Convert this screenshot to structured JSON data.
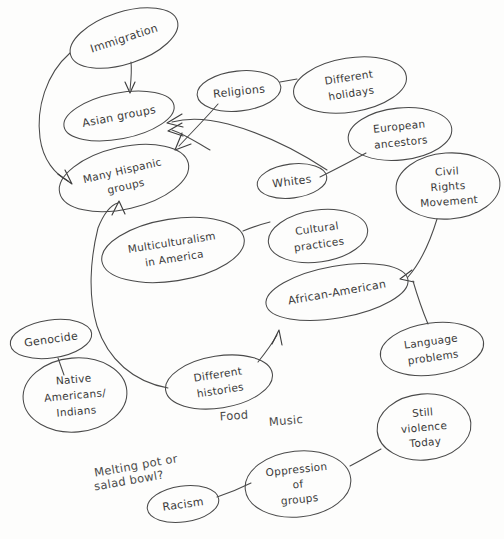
{
  "document": {
    "kind": "hand-drawn-concept-map",
    "title": "Multiculturalism in America concept map",
    "background_color": "#fdfdfc",
    "ink_color": "#4a4a4a",
    "width": 504,
    "height": 539
  },
  "nodes": [
    {
      "id": "immigration",
      "label": "Immigration",
      "lines": [
        "Immigration"
      ],
      "cx": 124,
      "cy": 38,
      "rx": 56,
      "ry": 26,
      "rot": -18
    },
    {
      "id": "asian-groups",
      "label": "Asian groups",
      "lines": [
        "Asian groups"
      ],
      "cx": 119,
      "cy": 116,
      "rx": 56,
      "ry": 23,
      "rot": -11
    },
    {
      "id": "many-hispanic",
      "label": "Many Hispanic groups",
      "lines": [
        "Many Hispanic",
        "groups"
      ],
      "cx": 124,
      "cy": 178,
      "rx": 66,
      "ry": 31,
      "rot": -13
    },
    {
      "id": "religions",
      "label": "Religions",
      "lines": [
        "Religions"
      ],
      "cx": 239,
      "cy": 91,
      "rx": 42,
      "ry": 20,
      "rot": -6
    },
    {
      "id": "different-holidays",
      "label": "Different holidays",
      "lines": [
        "Different",
        "holidays"
      ],
      "cx": 350,
      "cy": 85,
      "rx": 57,
      "ry": 27,
      "rot": -9
    },
    {
      "id": "european-ancestors",
      "label": "European ancestors",
      "lines": [
        "European",
        "ancestors"
      ],
      "cx": 400,
      "cy": 134,
      "rx": 52,
      "ry": 26,
      "rot": -6
    },
    {
      "id": "civil-rights",
      "label": "Civil Rights Movement",
      "lines": [
        "Civil",
        "Rights",
        "Movement"
      ],
      "cx": 448,
      "cy": 186,
      "rx": 52,
      "ry": 33,
      "rot": -4
    },
    {
      "id": "whites",
      "label": "Whites",
      "lines": [
        "Whites"
      ],
      "cx": 292,
      "cy": 181,
      "rx": 35,
      "ry": 17,
      "rot": -7
    },
    {
      "id": "cultural-practices",
      "label": "Cultural practices",
      "lines": [
        "Cultural",
        "practices"
      ],
      "cx": 318,
      "cy": 236,
      "rx": 50,
      "ry": 26,
      "rot": -8
    },
    {
      "id": "multiculturalism",
      "label": "Multiculturalism in America",
      "lines": [
        "Multiculturalism",
        "in America"
      ],
      "cx": 173,
      "cy": 250,
      "rx": 72,
      "ry": 31,
      "rot": -9
    },
    {
      "id": "african-american",
      "label": "African-American",
      "lines": [
        "African-American"
      ],
      "cx": 337,
      "cy": 292,
      "rx": 72,
      "ry": 26,
      "rot": -10
    },
    {
      "id": "language-problems",
      "label": "Language problems",
      "lines": [
        "Language",
        "problems"
      ],
      "cx": 432,
      "cy": 349,
      "rx": 52,
      "ry": 26,
      "rot": -8
    },
    {
      "id": "still-violence",
      "label": "Still violence Today",
      "lines": [
        "Still",
        "violence",
        "Today"
      ],
      "cx": 424,
      "cy": 427,
      "rx": 47,
      "ry": 33,
      "rot": -5
    },
    {
      "id": "oppression",
      "label": "Oppression of groups",
      "lines": [
        "Oppression",
        "of",
        "groups"
      ],
      "cx": 298,
      "cy": 484,
      "rx": 53,
      "ry": 33,
      "rot": -6
    },
    {
      "id": "racism",
      "label": "Racism",
      "lines": [
        "Racism"
      ],
      "cx": 183,
      "cy": 504,
      "rx": 36,
      "ry": 18,
      "rot": -8
    },
    {
      "id": "different-histories",
      "label": "Different histories",
      "lines": [
        "Different",
        "histories"
      ],
      "cx": 219,
      "cy": 382,
      "rx": 54,
      "ry": 26,
      "rot": -9
    },
    {
      "id": "native-americans",
      "label": "Native Americans/ Indians",
      "lines": [
        "Native",
        "Americans/",
        "Indians"
      ],
      "cx": 75,
      "cy": 395,
      "rx": 52,
      "ry": 37,
      "rot": -5
    },
    {
      "id": "genocide",
      "label": "Genocide",
      "lines": [
        "Genocide"
      ],
      "cx": 51,
      "cy": 339,
      "rx": 41,
      "ry": 19,
      "rot": -8
    }
  ],
  "free_labels": [
    {
      "id": "food",
      "text": "Food",
      "x": 234,
      "y": 416,
      "rot": -4
    },
    {
      "id": "music",
      "text": "Music",
      "x": 286,
      "y": 421,
      "rot": -5
    },
    {
      "id": "melting-pot-1",
      "text": "Melting pot or",
      "x": 136,
      "y": 466,
      "rot": -10
    },
    {
      "id": "melting-pot-2",
      "text": "salad bowl?",
      "x": 129,
      "y": 481,
      "rot": -10
    }
  ],
  "edges": [
    {
      "id": "immigration-to-asian",
      "from": "Immigration",
      "to": "Asian groups",
      "arrow": "to"
    },
    {
      "id": "immigration-to-hispanic",
      "from": "Immigration",
      "to": "Many Hispanic groups",
      "arrow": "to"
    },
    {
      "id": "religions-to-hispanic",
      "from": "Religions",
      "to": "Many Hispanic groups",
      "arrow": "to"
    },
    {
      "id": "whites-region-to-asian",
      "from": "Whites",
      "to": "Asian groups",
      "arrow": "to"
    },
    {
      "id": "religions-to-holidays",
      "from": "Religions",
      "to": "Different holidays",
      "arrow": "none"
    },
    {
      "id": "european-to-whites",
      "from": "European ancestors",
      "to": "Whites",
      "arrow": "none"
    },
    {
      "id": "multiculturalism-to-cultural",
      "from": "Multiculturalism in America",
      "to": "Cultural practices",
      "arrow": "none"
    },
    {
      "id": "civilrights-to-african",
      "from": "Civil Rights Movement",
      "to": "African-American",
      "arrow": "to"
    },
    {
      "id": "civilrights-to-language",
      "from": "Civil Rights Movement",
      "to": "Language problems",
      "arrow": "none"
    },
    {
      "id": "histories-to-african",
      "from": "Different histories",
      "to": "African-American",
      "arrow": "to"
    },
    {
      "id": "histories-to-hispanic",
      "from": "Different histories",
      "to": "Many Hispanic groups",
      "arrow": "to"
    },
    {
      "id": "genocide-to-native",
      "from": "Genocide",
      "to": "Native Americans/ Indians",
      "arrow": "none"
    },
    {
      "id": "racism-to-oppression",
      "from": "Racism",
      "to": "Oppression of groups",
      "arrow": "none"
    },
    {
      "id": "oppression-to-violence",
      "from": "Oppression of groups",
      "to": "Still violence Today",
      "arrow": "none"
    }
  ]
}
